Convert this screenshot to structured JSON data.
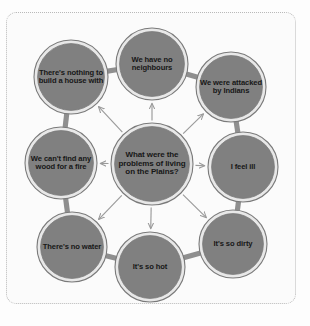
{
  "diagram": {
    "type": "spider-web-mind-map",
    "center": {
      "id": "center",
      "label": "What were the problems of living on the Plains?",
      "cx": 152,
      "cy": 164,
      "r": 41
    },
    "nodes": [
      {
        "id": "no-neighbours",
        "label": "We have no neighbours",
        "cx": 152,
        "cy": 64,
        "r": 36
      },
      {
        "id": "attacked",
        "label": "We were attacked by Indians",
        "cx": 231,
        "cy": 87,
        "r": 35
      },
      {
        "id": "feel-ill",
        "label": "I feel ill",
        "cx": 243,
        "cy": 167,
        "r": 35
      },
      {
        "id": "so-dirty",
        "label": "It's so dirty",
        "cx": 233,
        "cy": 244,
        "r": 34
      },
      {
        "id": "so-hot",
        "label": "It's so hot",
        "cx": 150,
        "cy": 267,
        "r": 35
      },
      {
        "id": "no-water",
        "label": "There's no water",
        "cx": 72,
        "cy": 247,
        "r": 35
      },
      {
        "id": "no-wood",
        "label": "We can't find any wood for a fire",
        "cx": 61,
        "cy": 163,
        "r": 36
      },
      {
        "id": "nothing-build",
        "label": "There's nothing to build a house with",
        "cx": 71,
        "cy": 77,
        "r": 37
      }
    ],
    "ring_links": [
      [
        "nothing-build",
        "no-neighbours"
      ],
      [
        "no-neighbours",
        "attacked"
      ],
      [
        "attacked",
        "feel-ill"
      ],
      [
        "feel-ill",
        "so-dirty"
      ],
      [
        "so-dirty",
        "so-hot"
      ],
      [
        "so-hot",
        "no-water"
      ],
      [
        "no-water",
        "no-wood"
      ],
      [
        "no-wood",
        "nothing-build"
      ]
    ],
    "colors": {
      "node_fill": "#808080",
      "node_ring": "#e8e8e8",
      "node_stroke": "#7a7a7a",
      "link": "#8f8f8f",
      "arrow": "#9a9a9a",
      "text": "#171717",
      "frame_border": "#b9b9b9",
      "background": "#fbfbfb"
    }
  }
}
